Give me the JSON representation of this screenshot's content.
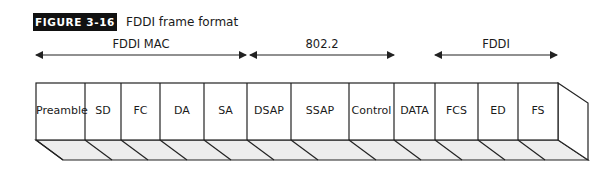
{
  "figure": {
    "badge": "FIGURE 3-16",
    "title": "FDDI frame format"
  },
  "spans": [
    {
      "label": "FDDI MAC",
      "x1": 36,
      "x2": 246,
      "label_center": 141
    },
    {
      "label": "802.2",
      "x1": 250,
      "x2": 394,
      "label_center": 322
    },
    {
      "label": "FDDI",
      "x1": 435,
      "x2": 557,
      "label_center": 496
    }
  ],
  "fields": [
    {
      "label": "Preamble",
      "x1": 36,
      "x2": 85
    },
    {
      "label": "SD",
      "x1": 85,
      "x2": 121
    },
    {
      "label": "FC",
      "x1": 121,
      "x2": 160
    },
    {
      "label": "DA",
      "x1": 160,
      "x2": 204
    },
    {
      "label": "SA",
      "x1": 204,
      "x2": 247
    },
    {
      "label": "DSAP",
      "x1": 247,
      "x2": 291
    },
    {
      "label": "SSAP",
      "x1": 291,
      "x2": 349
    },
    {
      "label": "Control",
      "x1": 349,
      "x2": 394
    },
    {
      "label": "DATA",
      "x1": 394,
      "x2": 435
    },
    {
      "label": "FCS",
      "x1": 435,
      "x2": 478
    },
    {
      "label": "ED",
      "x1": 478,
      "x2": 518
    },
    {
      "label": "FS",
      "x1": 518,
      "x2": 558
    }
  ],
  "colors": {
    "line": "#222222",
    "bottom_face": "#ededed",
    "badge_bg": "#111111"
  }
}
